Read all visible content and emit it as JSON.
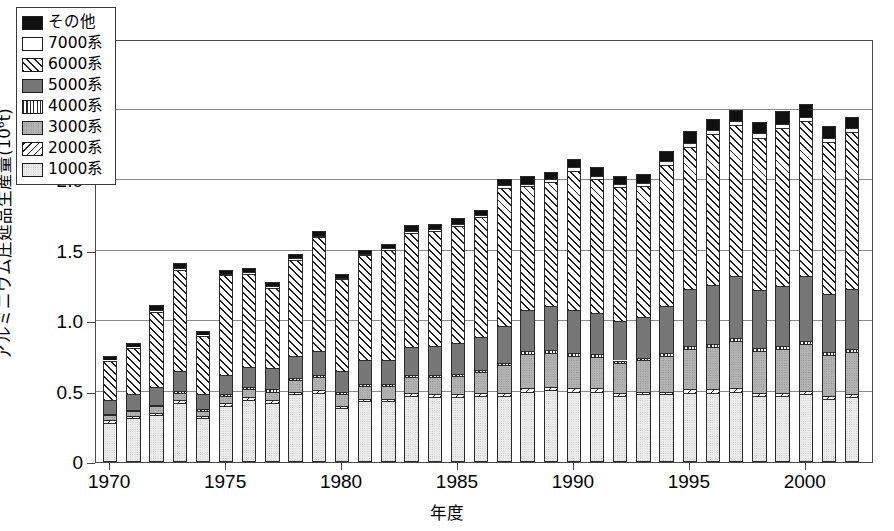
{
  "chart_data": {
    "type": "bar",
    "subtype": "stacked-bar",
    "title": "",
    "xlabel": "年度",
    "ylabel": "アルミニウム圧延品生産量(10⁶t)",
    "ylabel_main": "アルミニウム圧延品生産量(10",
    "ylabel_sup": "6",
    "ylabel_tail": "t)",
    "ylim": [
      0,
      3.0
    ],
    "ytick_labels": [
      "0",
      "0.5",
      "1.0",
      "1.5",
      "2.0",
      "2.5",
      "3.0"
    ],
    "ytick_values": [
      0,
      0.5,
      1.0,
      1.5,
      2.0,
      2.5,
      3.0
    ],
    "xtick_labels": [
      "1970",
      "1975",
      "1980",
      "1985",
      "1990",
      "1995",
      "2000"
    ],
    "xtick_values": [
      1970,
      1975,
      1980,
      1985,
      1990,
      1995,
      2000
    ],
    "grid": "horizontal",
    "legend_position": "top-left",
    "categories": [
      1970,
      1971,
      1972,
      1973,
      1974,
      1975,
      1976,
      1977,
      1978,
      1979,
      1980,
      1981,
      1982,
      1983,
      1984,
      1985,
      1986,
      1987,
      1988,
      1989,
      1990,
      1991,
      1992,
      1993,
      1994,
      1995,
      1996,
      1997,
      1998,
      1999,
      2000,
      2001,
      2002
    ],
    "series": [
      {
        "name": "1000系",
        "pattern": "p-1000",
        "values": [
          0.28,
          0.31,
          0.33,
          0.42,
          0.31,
          0.4,
          0.44,
          0.42,
          0.48,
          0.49,
          0.38,
          0.43,
          0.43,
          0.47,
          0.46,
          0.46,
          0.47,
          0.47,
          0.5,
          0.51,
          0.5,
          0.5,
          0.47,
          0.48,
          0.48,
          0.49,
          0.49,
          0.5,
          0.47,
          0.47,
          0.48,
          0.45,
          0.46
        ]
      },
      {
        "name": "2000系",
        "pattern": "p-2000",
        "values": [
          0.015,
          0.015,
          0.015,
          0.02,
          0.015,
          0.02,
          0.02,
          0.02,
          0.02,
          0.02,
          0.02,
          0.02,
          0.02,
          0.02,
          0.02,
          0.02,
          0.02,
          0.02,
          0.025,
          0.025,
          0.025,
          0.025,
          0.02,
          0.02,
          0.02,
          0.025,
          0.025,
          0.025,
          0.02,
          0.02,
          0.025,
          0.02,
          0.02
        ]
      },
      {
        "name": "3000系",
        "pattern": "p-3000",
        "values": [
          0.035,
          0.035,
          0.05,
          0.05,
          0.04,
          0.05,
          0.06,
          0.06,
          0.08,
          0.09,
          0.08,
          0.09,
          0.09,
          0.11,
          0.12,
          0.13,
          0.15,
          0.2,
          0.24,
          0.24,
          0.23,
          0.22,
          0.21,
          0.22,
          0.25,
          0.29,
          0.3,
          0.33,
          0.3,
          0.31,
          0.33,
          0.29,
          0.3
        ]
      },
      {
        "name": "4000系",
        "pattern": "p-4000",
        "values": [
          0.01,
          0.01,
          0.01,
          0.015,
          0.01,
          0.015,
          0.015,
          0.015,
          0.015,
          0.015,
          0.015,
          0.015,
          0.015,
          0.015,
          0.015,
          0.015,
          0.015,
          0.015,
          0.02,
          0.02,
          0.02,
          0.02,
          0.02,
          0.02,
          0.02,
          0.02,
          0.02,
          0.025,
          0.02,
          0.02,
          0.025,
          0.02,
          0.02
        ]
      },
      {
        "name": "5000系",
        "pattern": "p-5000",
        "values": [
          0.1,
          0.11,
          0.13,
          0.14,
          0.11,
          0.13,
          0.14,
          0.15,
          0.16,
          0.17,
          0.15,
          0.17,
          0.17,
          0.2,
          0.21,
          0.22,
          0.23,
          0.26,
          0.29,
          0.31,
          0.3,
          0.29,
          0.28,
          0.29,
          0.34,
          0.4,
          0.42,
          0.44,
          0.41,
          0.43,
          0.46,
          0.41,
          0.43
        ]
      },
      {
        "name": "6000系",
        "pattern": "p-6000",
        "values": [
          0.28,
          0.33,
          0.53,
          0.72,
          0.41,
          0.71,
          0.66,
          0.57,
          0.68,
          0.81,
          0.65,
          0.74,
          0.78,
          0.81,
          0.81,
          0.83,
          0.85,
          0.98,
          0.88,
          0.88,
          0.99,
          0.95,
          0.95,
          0.93,
          1.0,
          1.01,
          1.07,
          1.07,
          1.08,
          1.12,
          1.1,
          1.08,
          1.11
        ]
      },
      {
        "name": "7000系",
        "pattern": "p-7000",
        "values": [
          0.005,
          0.005,
          0.01,
          0.01,
          0.005,
          0.01,
          0.01,
          0.01,
          0.01,
          0.01,
          0.01,
          0.01,
          0.01,
          0.015,
          0.015,
          0.015,
          0.015,
          0.02,
          0.02,
          0.02,
          0.025,
          0.025,
          0.02,
          0.02,
          0.025,
          0.03,
          0.03,
          0.03,
          0.03,
          0.03,
          0.03,
          0.03,
          0.03
        ]
      },
      {
        "name": "その他",
        "pattern": "p-other",
        "values": [
          0.03,
          0.03,
          0.04,
          0.04,
          0.03,
          0.03,
          0.03,
          0.03,
          0.03,
          0.03,
          0.03,
          0.03,
          0.03,
          0.04,
          0.04,
          0.04,
          0.04,
          0.04,
          0.05,
          0.05,
          0.06,
          0.06,
          0.06,
          0.06,
          0.07,
          0.08,
          0.08,
          0.08,
          0.08,
          0.09,
          0.09,
          0.08,
          0.08
        ]
      }
    ],
    "totals": [
      0.735,
      0.845,
      1.095,
      1.415,
      0.93,
      1.365,
      1.375,
      1.265,
      1.475,
      1.635,
      1.335,
      1.505,
      1.545,
      1.68,
      1.69,
      1.73,
      1.79,
      2.005,
      2.025,
      2.055,
      2.15,
      2.09,
      2.03,
      2.06,
      2.205,
      2.345,
      2.435,
      2.5,
      2.41,
      2.49,
      2.54,
      2.38,
      2.45
    ]
  },
  "legend": {
    "items": [
      {
        "label": "その他",
        "pattern": "p-other"
      },
      {
        "label": "7000系",
        "pattern": "p-7000"
      },
      {
        "label": "6000系",
        "pattern": "p-6000"
      },
      {
        "label": "5000系",
        "pattern": "p-5000"
      },
      {
        "label": "4000系",
        "pattern": "p-4000"
      },
      {
        "label": "3000系",
        "pattern": "p-3000"
      },
      {
        "label": "2000系",
        "pattern": "p-2000"
      },
      {
        "label": "1000系",
        "pattern": "p-1000"
      }
    ]
  },
  "colors": {
    "frame": "#4a4a4a",
    "gridline": "#8a8a8a",
    "other": "#101010",
    "s7000": "#ffffff",
    "s5000": "#777777",
    "s3000": "#b3b3b3",
    "s1000": "#ececec",
    "background": "#ffffff"
  }
}
